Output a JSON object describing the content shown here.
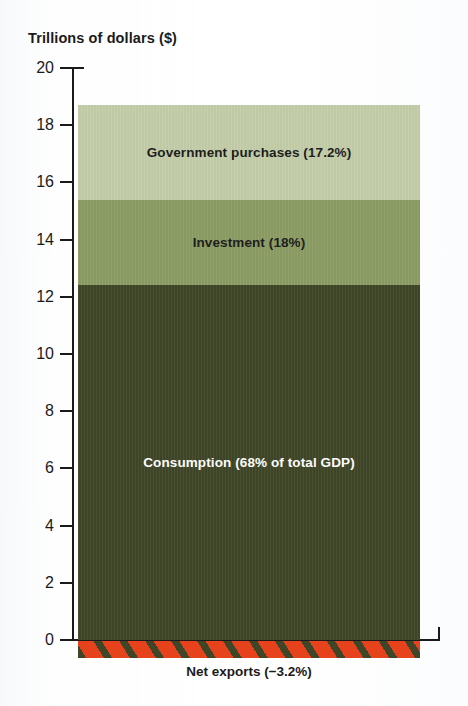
{
  "chart_data": {
    "type": "bar",
    "title": "Trillions of dollars ($)",
    "xlabel": "",
    "ylabel": "Trillions of dollars ($)",
    "ylim": [
      0,
      20
    ],
    "yticks": [
      20,
      18,
      16,
      14,
      12,
      10,
      8,
      6,
      4,
      2,
      0
    ],
    "grid": false,
    "legend": "none",
    "stacked": true,
    "categories": [
      "GDP"
    ],
    "series": [
      {
        "name": "Consumption",
        "label": "Consumption (68% of total GDP)",
        "percent": 68,
        "value": 12.4,
        "y_start": 0,
        "y_end": 12.4,
        "color": "#3f4628",
        "text_color": "#ffffff"
      },
      {
        "name": "Investment",
        "label": "Investment (18%)",
        "percent": 18,
        "value": 3.0,
        "y_start": 12.4,
        "y_end": 15.4,
        "color": "#8c9c64",
        "text_color": "#1b1b1b"
      },
      {
        "name": "Government purchases",
        "label": "Government purchases (17.2%)",
        "percent": 17.2,
        "value": 3.3,
        "y_start": 15.4,
        "y_end": 18.7,
        "color": "#c3cda8",
        "text_color": "#1b1b1b"
      },
      {
        "name": "Net exports",
        "label": "Net exports (−3.2%)",
        "percent": -3.2,
        "value": -0.6,
        "y_start": 0,
        "y_end": -0.6,
        "color": "#e6421b",
        "hatch_color": "#3f4628",
        "text_color": "#1b1b1b"
      }
    ]
  },
  "axis": {
    "ticks": [
      {
        "label": "20"
      },
      {
        "label": "18"
      },
      {
        "label": "16"
      },
      {
        "label": "14"
      },
      {
        "label": "12"
      },
      {
        "label": "10"
      },
      {
        "label": "8"
      },
      {
        "label": "6"
      },
      {
        "label": "4"
      },
      {
        "label": "2"
      },
      {
        "label": "0"
      }
    ]
  },
  "labels": {
    "government": "Government purchases (17.2%)",
    "investment": "Investment (18%)",
    "consumption": "Consumption (68% of total GDP)",
    "net_exports": "Net exports (−3.2%)"
  }
}
